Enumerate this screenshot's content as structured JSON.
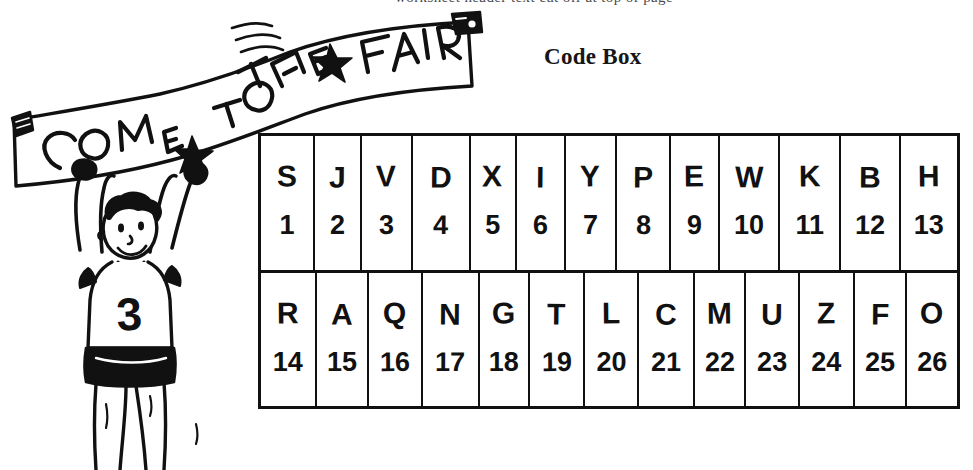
{
  "page": {
    "background_color": "#ffffff",
    "ink_color": "#111111",
    "top_cut_text": "worksheet header text cut off at top of page"
  },
  "heading": {
    "title": "Code Box"
  },
  "illustration": {
    "name": "boy-holding-banner",
    "banner_text": "COME TO THE FAIR",
    "banner_words": [
      "COME",
      "TO",
      "THE",
      "FAIR"
    ],
    "star_count": 2,
    "jersey_number": "3",
    "description": "Hand-drawn cartoon of a smiling boy with curly hair wearing a jersey, arms raised overhead holding a long banner that reads COME TO THE FAIR with star decorations."
  },
  "code_box": {
    "columns": 13,
    "rows": [
      {
        "name": "row-1",
        "cells": [
          {
            "letter": "S",
            "number": "1"
          },
          {
            "letter": "J",
            "number": "2"
          },
          {
            "letter": "V",
            "number": "3"
          },
          {
            "letter": "D",
            "number": "4"
          },
          {
            "letter": "X",
            "number": "5"
          },
          {
            "letter": "I",
            "number": "6"
          },
          {
            "letter": "Y",
            "number": "7"
          },
          {
            "letter": "P",
            "number": "8"
          },
          {
            "letter": "E",
            "number": "9"
          },
          {
            "letter": "W",
            "number": "10"
          },
          {
            "letter": "K",
            "number": "11"
          },
          {
            "letter": "B",
            "number": "12"
          },
          {
            "letter": "H",
            "number": "13"
          }
        ]
      },
      {
        "name": "row-2",
        "cells": [
          {
            "letter": "R",
            "number": "14"
          },
          {
            "letter": "A",
            "number": "15"
          },
          {
            "letter": "Q",
            "number": "16"
          },
          {
            "letter": "N",
            "number": "17"
          },
          {
            "letter": "G",
            "number": "18"
          },
          {
            "letter": "T",
            "number": "19"
          },
          {
            "letter": "L",
            "number": "20"
          },
          {
            "letter": "C",
            "number": "21"
          },
          {
            "letter": "M",
            "number": "22"
          },
          {
            "letter": "U",
            "number": "23"
          },
          {
            "letter": "Z",
            "number": "24"
          },
          {
            "letter": "F",
            "number": "25"
          },
          {
            "letter": "O",
            "number": "26"
          }
        ]
      }
    ]
  }
}
